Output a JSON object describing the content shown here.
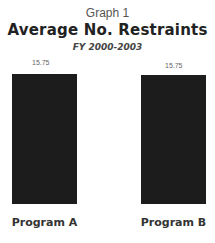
{
  "chart_data": {
    "type": "bar",
    "supertitle": "Graph 1",
    "title": "Average No. Restraints",
    "subtitle": "FY 2000-2003",
    "categories": [
      "Program A",
      "Program B"
    ],
    "values": [
      15.75,
      15.75
    ],
    "value_labels": [
      "15.75",
      "15.75"
    ],
    "xlabel": "",
    "ylabel": "",
    "ylim": [
      0,
      15.75
    ],
    "grid": false,
    "bar_color": "#1c1c1c"
  }
}
